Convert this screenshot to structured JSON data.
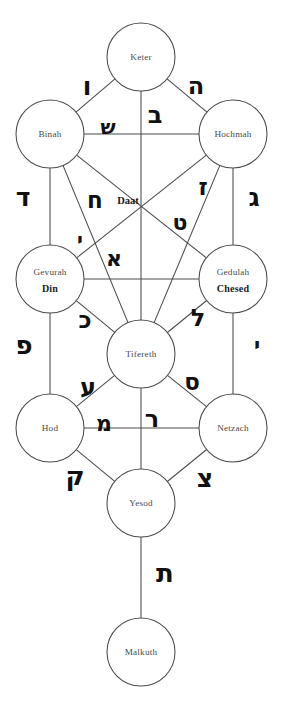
{
  "diagram": {
    "background_color": "#ffffff",
    "line_color": "#4a4a4a",
    "text_color": "#4a4a4a",
    "hebrew_color": "#111111"
  },
  "sephirot": [
    {
      "id": "keter",
      "label": "Keter",
      "alt_label": "",
      "cx": 141,
      "cy": 57,
      "r": 34
    },
    {
      "id": "binah",
      "label": "Binah",
      "alt_label": "",
      "cx": 50,
      "cy": 134,
      "r": 34
    },
    {
      "id": "hochmah",
      "label": "Hochmah",
      "alt_label": "",
      "cx": 233,
      "cy": 134,
      "r": 34
    },
    {
      "id": "gevurah",
      "label": "Gevurah",
      "alt_label": "Din",
      "cx": 50,
      "cy": 279,
      "r": 34
    },
    {
      "id": "gedulah",
      "label": "Gedulah",
      "alt_label": "Chesed",
      "cx": 233,
      "cy": 279,
      "r": 34
    },
    {
      "id": "tifereth",
      "label": "Tifereth",
      "alt_label": "",
      "cx": 141,
      "cy": 354,
      "r": 34
    },
    {
      "id": "hod",
      "label": "Hod",
      "alt_label": "",
      "cx": 50,
      "cy": 428,
      "r": 34
    },
    {
      "id": "netzach",
      "label": "Netzach",
      "alt_label": "",
      "cx": 233,
      "cy": 428,
      "r": 34
    },
    {
      "id": "yesod",
      "label": "Yesod",
      "alt_label": "",
      "cx": 141,
      "cy": 503,
      "r": 34
    },
    {
      "id": "malkuth",
      "label": "Malkuth",
      "alt_label": "",
      "cx": 141,
      "cy": 652,
      "r": 34
    }
  ],
  "daat": {
    "id": "daat",
    "label": "Daat",
    "x": 128,
    "y": 200
  },
  "paths": [
    {
      "id": "keter-binah",
      "from": "keter",
      "to": "binah"
    },
    {
      "id": "keter-hochmah",
      "from": "keter",
      "to": "hochmah"
    },
    {
      "id": "keter-tifereth",
      "from": "keter",
      "to": "tifereth"
    },
    {
      "id": "binah-hochmah",
      "from": "binah",
      "to": "hochmah"
    },
    {
      "id": "binah-gevurah",
      "from": "binah",
      "to": "gevurah"
    },
    {
      "id": "binah-tifereth",
      "from": "binah",
      "to": "tifereth"
    },
    {
      "id": "binah-gedulah",
      "from": "binah",
      "to": "gedulah"
    },
    {
      "id": "hochmah-gedulah",
      "from": "hochmah",
      "to": "gedulah"
    },
    {
      "id": "hochmah-tifereth",
      "from": "hochmah",
      "to": "tifereth"
    },
    {
      "id": "hochmah-gevurah",
      "from": "hochmah",
      "to": "gevurah"
    },
    {
      "id": "gevurah-gedulah",
      "from": "gevurah",
      "to": "gedulah"
    },
    {
      "id": "gevurah-tifereth",
      "from": "gevurah",
      "to": "tifereth"
    },
    {
      "id": "gevurah-hod",
      "from": "gevurah",
      "to": "hod"
    },
    {
      "id": "gedulah-tifereth",
      "from": "gedulah",
      "to": "tifereth"
    },
    {
      "id": "gedulah-netzach",
      "from": "gedulah",
      "to": "netzach"
    },
    {
      "id": "tifereth-hod",
      "from": "tifereth",
      "to": "hod"
    },
    {
      "id": "tifereth-netzach",
      "from": "tifereth",
      "to": "netzach"
    },
    {
      "id": "tifereth-yesod",
      "from": "tifereth",
      "to": "yesod"
    },
    {
      "id": "hod-netzach",
      "from": "hod",
      "to": "netzach"
    },
    {
      "id": "hod-yesod",
      "from": "hod",
      "to": "yesod"
    },
    {
      "id": "netzach-yesod",
      "from": "netzach",
      "to": "yesod"
    },
    {
      "id": "yesod-malkuth",
      "from": "yesod",
      "to": "malkuth"
    }
  ],
  "hebrew_letters": [
    {
      "id": "vav",
      "name": "vav",
      "glyph": "ו",
      "x": 87,
      "y": 86,
      "size": 25,
      "path": "keter-binah"
    },
    {
      "id": "heh",
      "name": "heh",
      "glyph": "ה",
      "x": 196,
      "y": 86,
      "size": 24,
      "path": "keter-hochmah"
    },
    {
      "id": "bet",
      "name": "bet",
      "glyph": "ב",
      "x": 155,
      "y": 115,
      "size": 24,
      "path": "keter-tifereth"
    },
    {
      "id": "shin",
      "name": "shin",
      "glyph": "ש",
      "x": 108,
      "y": 127,
      "size": 20,
      "path": "binah-hochmah"
    },
    {
      "id": "dalet",
      "name": "dalet",
      "glyph": "ד",
      "x": 23,
      "y": 197,
      "size": 25,
      "path": "binah-gevurah"
    },
    {
      "id": "gimel",
      "name": "gimel",
      "glyph": "ג",
      "x": 254,
      "y": 197,
      "size": 25,
      "path": "hochmah-gedulah"
    },
    {
      "id": "chet",
      "name": "chet",
      "glyph": "ח",
      "x": 95,
      "y": 200,
      "size": 23,
      "path": "binah-tifereth"
    },
    {
      "id": "zayin",
      "name": "zayin",
      "glyph": "ז",
      "x": 203,
      "y": 187,
      "size": 23,
      "path": "hochmah-tifereth"
    },
    {
      "id": "tet",
      "name": "tet",
      "glyph": "ט",
      "x": 180,
      "y": 222,
      "size": 22,
      "path": "hochmah-gevurah"
    },
    {
      "id": "yod",
      "name": "yod",
      "glyph": "י",
      "x": 80,
      "y": 240,
      "size": 20,
      "path": "binah-gedulah"
    },
    {
      "id": "alef",
      "name": "alef",
      "glyph": "א",
      "x": 114,
      "y": 258,
      "size": 22,
      "path": "gevurah-tifereth"
    },
    {
      "id": "kaf",
      "name": "kaf",
      "glyph": "כ",
      "x": 85,
      "y": 320,
      "size": 23,
      "path": "gevurah-tifereth-b"
    },
    {
      "id": "lamed",
      "name": "lamed",
      "glyph": "ל",
      "x": 198,
      "y": 318,
      "size": 24,
      "path": "gedulah-tifereth"
    },
    {
      "id": "pe",
      "name": "pe",
      "glyph": "פ",
      "x": 24,
      "y": 345,
      "size": 26,
      "path": "gevurah-hod"
    },
    {
      "id": "yod2",
      "name": "yod",
      "glyph": "י",
      "x": 257,
      "y": 345,
      "size": 21,
      "path": "gedulah-netzach"
    },
    {
      "id": "ayin",
      "name": "ayin",
      "glyph": "ע",
      "x": 88,
      "y": 387,
      "size": 24,
      "path": "tifereth-hod"
    },
    {
      "id": "samekh",
      "name": "samekh",
      "glyph": "ס",
      "x": 192,
      "y": 382,
      "size": 23,
      "path": "tifereth-netzach"
    },
    {
      "id": "mem",
      "name": "mem",
      "glyph": "מ",
      "x": 104,
      "y": 423,
      "size": 22,
      "path": "hod-netzach"
    },
    {
      "id": "resh",
      "name": "resh",
      "glyph": "ר",
      "x": 152,
      "y": 419,
      "size": 24,
      "path": "tifereth-yesod"
    },
    {
      "id": "qof",
      "name": "qof",
      "glyph": "ק",
      "x": 75,
      "y": 476,
      "size": 26,
      "path": "hod-yesod"
    },
    {
      "id": "tsadi",
      "name": "tsadi",
      "glyph": "צ",
      "x": 205,
      "y": 478,
      "size": 25,
      "path": "netzach-yesod"
    },
    {
      "id": "tav",
      "name": "tav",
      "glyph": "ת",
      "x": 165,
      "y": 573,
      "size": 26,
      "path": "yesod-malkuth"
    }
  ]
}
